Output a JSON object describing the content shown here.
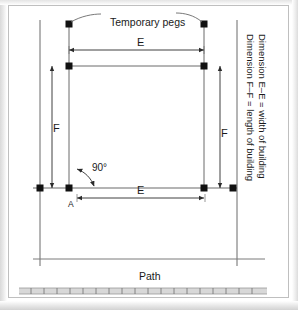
{
  "figure": {
    "title_visible": false,
    "labels": {
      "temporary_pegs": "Temporary pegs",
      "dimension_e_top": "E",
      "dimension_e_bottom": "E",
      "dimension_f_left": "F",
      "dimension_f_right": "F",
      "right_angle": "90°",
      "point_a": "A",
      "path": "Path"
    },
    "caption_lines": [
      "Dimension E–E = width of building",
      "Dimension F–F = length of building"
    ],
    "colors": {
      "line": "#555555",
      "peg": "#111111",
      "text": "#1a1a1a",
      "frame": "#bfbfbf",
      "background": "#ffffff",
      "path_band": "#bdbdbd"
    },
    "elements": {
      "site_boundary_left": "vertical boundary line",
      "site_boundary_right": "vertical boundary line",
      "building_outline": "rectangle set out with pegs",
      "pegs_count": 8,
      "path_band": "hatched path strip along bottom"
    }
  }
}
